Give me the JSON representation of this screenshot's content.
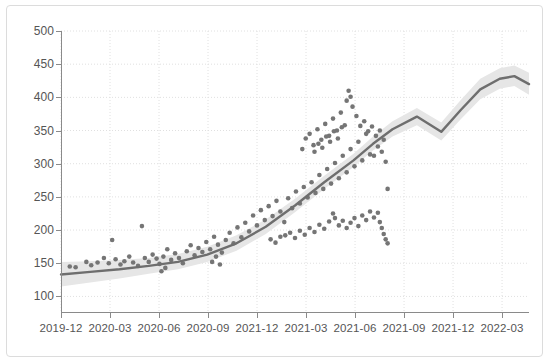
{
  "chart_data": {
    "type": "scatter",
    "title": "",
    "subtitle": "",
    "xlabel": "",
    "ylabel": "",
    "xlim": [
      "2019-12",
      "2022-03"
    ],
    "ylim": [
      75,
      500
    ],
    "grid": true,
    "legend": null,
    "y_ticks": [
      500,
      450,
      400,
      350,
      300,
      250,
      200,
      150,
      100
    ],
    "x_ticks": [
      "2019-12",
      "2020-03",
      "2020-06",
      "2020-09",
      "2021-12",
      "2021-03",
      "2021-06",
      "2021-09",
      "2021-12",
      "2022-03"
    ],
    "colors": {
      "point": "#757575",
      "trend_line": "#6e6e6e",
      "confidence_band": "#e6e6e6",
      "grid": "#e0e0e0",
      "axis": "#8a8a8a",
      "tick_text": "#555555",
      "figure_border": "#dcdcdc",
      "background": "#ffffff"
    },
    "series": [
      {
        "name": "trend",
        "type": "line",
        "x": [
          0,
          0.6,
          1.2,
          1.8,
          2.4,
          3.0,
          3.6,
          4.2,
          4.8,
          5.4,
          6.0,
          6.4,
          6.8,
          7.3,
          7.8,
          8.2,
          8.6,
          9.0,
          9.3,
          9.6
        ],
        "values": [
          133,
          137,
          141,
          146,
          152,
          163,
          180,
          205,
          237,
          272,
          305,
          330,
          352,
          371,
          348,
          381,
          412,
          428,
          432,
          420
        ]
      },
      {
        "name": "confidence_band_upper",
        "type": "line",
        "x": [
          0,
          0.6,
          1.2,
          1.8,
          2.4,
          3.0,
          3.6,
          4.2,
          4.8,
          5.4,
          6.0,
          6.4,
          6.8,
          7.3,
          7.8,
          8.2,
          8.6,
          9.0,
          9.3,
          9.6
        ],
        "values": [
          152,
          153,
          155,
          158,
          164,
          175,
          192,
          216,
          247,
          282,
          315,
          341,
          364,
          384,
          362,
          396,
          428,
          444,
          448,
          437
        ]
      },
      {
        "name": "confidence_band_lower",
        "type": "line",
        "x": [
          0,
          0.6,
          1.2,
          1.8,
          2.4,
          3.0,
          3.6,
          4.2,
          4.8,
          5.4,
          6.0,
          6.4,
          6.8,
          7.3,
          7.8,
          8.2,
          8.6,
          9.0,
          9.3,
          9.6
        ],
        "values": [
          115,
          121,
          127,
          134,
          141,
          152,
          169,
          194,
          227,
          262,
          295,
          320,
          341,
          358,
          335,
          367,
          397,
          413,
          417,
          404
        ]
      },
      {
        "name": "observations",
        "type": "scatter",
        "points": [
          [
            0.18,
            145
          ],
          [
            0.3,
            144
          ],
          [
            0.52,
            152
          ],
          [
            0.62,
            147
          ],
          [
            0.75,
            151
          ],
          [
            0.88,
            158
          ],
          [
            0.98,
            150
          ],
          [
            1.05,
            185
          ],
          [
            1.12,
            156
          ],
          [
            1.22,
            148
          ],
          [
            1.3,
            153
          ],
          [
            1.4,
            160
          ],
          [
            1.48,
            151
          ],
          [
            1.58,
            146
          ],
          [
            1.66,
            206
          ],
          [
            1.72,
            158
          ],
          [
            1.8,
            152
          ],
          [
            1.88,
            163
          ],
          [
            1.96,
            157
          ],
          [
            2.02,
            149
          ],
          [
            2.1,
            160
          ],
          [
            2.18,
            171
          ],
          [
            2.26,
            155
          ],
          [
            2.34,
            165
          ],
          [
            2.42,
            158
          ],
          [
            2.5,
            150
          ],
          [
            2.58,
            168
          ],
          [
            2.66,
            177
          ],
          [
            2.74,
            162
          ],
          [
            2.82,
            173
          ],
          [
            2.9,
            167
          ],
          [
            2.98,
            182
          ],
          [
            3.06,
            171
          ],
          [
            3.14,
            190
          ],
          [
            3.22,
            178
          ],
          [
            3.3,
            166
          ],
          [
            3.38,
            185
          ],
          [
            3.46,
            196
          ],
          [
            3.54,
            180
          ],
          [
            3.62,
            204
          ],
          [
            3.7,
            189
          ],
          [
            3.78,
            211
          ],
          [
            3.86,
            198
          ],
          [
            3.94,
            222
          ],
          [
            4.02,
            207
          ],
          [
            4.1,
            230
          ],
          [
            4.18,
            215
          ],
          [
            4.26,
            236
          ],
          [
            4.34,
            221
          ],
          [
            4.42,
            244
          ],
          [
            4.5,
            228
          ],
          [
            4.58,
            212
          ],
          [
            4.66,
            248
          ],
          [
            4.74,
            233
          ],
          [
            4.82,
            258
          ],
          [
            4.9,
            240
          ],
          [
            4.98,
            265
          ],
          [
            5.06,
            249
          ],
          [
            5.14,
            272
          ],
          [
            5.22,
            256
          ],
          [
            5.3,
            283
          ],
          [
            5.38,
            262
          ],
          [
            5.46,
            292
          ],
          [
            5.54,
            270
          ],
          [
            5.62,
            301
          ],
          [
            5.7,
            278
          ],
          [
            5.78,
            312
          ],
          [
            5.86,
            287
          ],
          [
            5.94,
            322
          ],
          [
            6.02,
            296
          ],
          [
            6.1,
            333
          ],
          [
            6.18,
            305
          ],
          [
            6.26,
            345
          ],
          [
            6.34,
            314
          ],
          [
            4.95,
            322
          ],
          [
            5.02,
            338
          ],
          [
            5.1,
            345
          ],
          [
            5.18,
            328
          ],
          [
            5.26,
            352
          ],
          [
            5.34,
            336
          ],
          [
            5.42,
            360
          ],
          [
            5.5,
            342
          ],
          [
            5.58,
            368
          ],
          [
            5.66,
            350
          ],
          [
            5.74,
            377
          ],
          [
            5.82,
            358
          ],
          [
            5.86,
            395
          ],
          [
            5.9,
            410
          ],
          [
            5.94,
            401
          ],
          [
            5.98,
            386
          ],
          [
            6.06,
            372
          ],
          [
            6.14,
            357
          ],
          [
            6.22,
            364
          ],
          [
            6.3,
            349
          ],
          [
            6.38,
            356
          ],
          [
            6.46,
            342
          ],
          [
            6.54,
            350
          ],
          [
            6.62,
            336
          ],
          [
            5.2,
            318
          ],
          [
            5.28,
            330
          ],
          [
            5.36,
            324
          ],
          [
            5.44,
            341
          ],
          [
            5.52,
            333
          ],
          [
            5.6,
            349
          ],
          [
            5.68,
            338
          ],
          [
            5.76,
            355
          ],
          [
            6.42,
            312
          ],
          [
            6.5,
            326
          ],
          [
            6.58,
            318
          ],
          [
            6.66,
            303
          ],
          [
            6.7,
            262
          ],
          [
            4.6,
            192
          ],
          [
            4.7,
            196
          ],
          [
            4.8,
            188
          ],
          [
            4.9,
            199
          ],
          [
            5.0,
            193
          ],
          [
            5.1,
            203
          ],
          [
            5.2,
            197
          ],
          [
            5.3,
            208
          ],
          [
            5.4,
            202
          ],
          [
            5.5,
            213
          ],
          [
            5.58,
            225
          ],
          [
            5.62,
            218
          ],
          [
            5.7,
            207
          ],
          [
            5.78,
            214
          ],
          [
            5.86,
            203
          ],
          [
            5.94,
            211
          ],
          [
            6.02,
            218
          ],
          [
            6.1,
            206
          ],
          [
            6.18,
            222
          ],
          [
            6.26,
            215
          ],
          [
            6.34,
            228
          ],
          [
            6.42,
            219
          ],
          [
            6.5,
            226
          ],
          [
            6.54,
            212
          ],
          [
            6.58,
            203
          ],
          [
            6.62,
            194
          ],
          [
            6.66,
            186
          ],
          [
            6.7,
            180
          ],
          [
            4.3,
            186
          ],
          [
            4.4,
            181
          ],
          [
            4.5,
            190
          ],
          [
            3.1,
            152
          ],
          [
            3.18,
            160
          ],
          [
            3.26,
            148
          ],
          [
            2.06,
            138
          ],
          [
            2.14,
            143
          ]
        ]
      }
    ]
  }
}
